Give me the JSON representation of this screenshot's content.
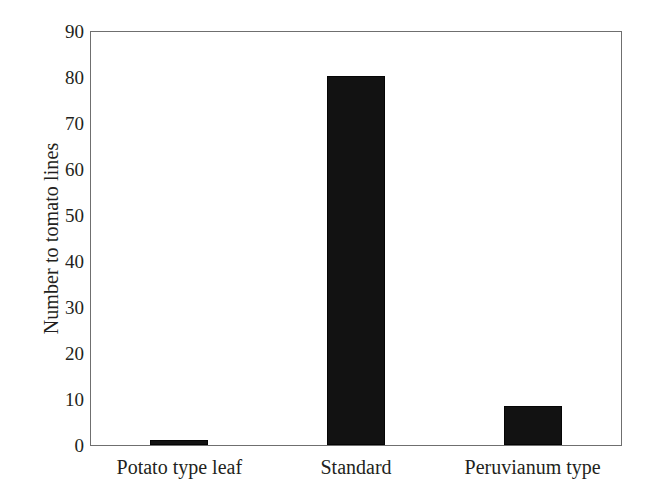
{
  "chart_data": {
    "type": "bar",
    "title": "",
    "subtitle": "",
    "xlabel": "",
    "ylabel": "Number to tomato lines",
    "categories": [
      "Potato type leaf",
      "Standard",
      "Peruvianum type"
    ],
    "values": [
      1,
      80.5,
      8.5
    ],
    "series": [
      {
        "name": "Number to tomato lines",
        "values": [
          1,
          80.5,
          8.5
        ]
      }
    ],
    "ylim": [
      0,
      90
    ],
    "ytick_values": [
      0,
      10,
      20,
      30,
      40,
      50,
      60,
      70,
      80,
      90
    ],
    "ytick_labels": [
      "0",
      "10",
      "20",
      "30",
      "40",
      "50",
      "60",
      "70",
      "80",
      "90"
    ],
    "grid": false,
    "legend": false,
    "legend_position": "none",
    "annotations": [],
    "bar_color": "#121212",
    "frame_color": "#6f6f6f",
    "background_color": "#ffffff",
    "text_color": "#231f20"
  }
}
